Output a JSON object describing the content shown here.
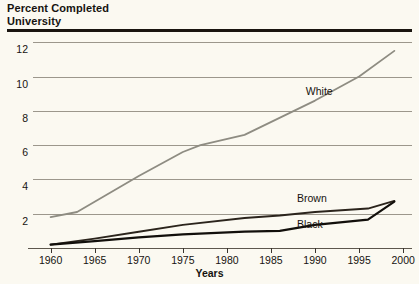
{
  "title": "Percent Completed\nUniversity",
  "chart_data": {
    "type": "line",
    "title": "Percent Completed University",
    "xlabel": "Years",
    "ylabel": "",
    "xlim": [
      1958,
      2001
    ],
    "ylim": [
      0,
      12.6
    ],
    "grid": true,
    "legend_position": "inline-labels",
    "xticks": [
      1960,
      1965,
      1970,
      1975,
      1980,
      1985,
      1990,
      1995,
      2000
    ],
    "xtick_labels": [
      "1960",
      "1965",
      "1970",
      "1975",
      "1980",
      "1985",
      "1990",
      "1995",
      "2000"
    ],
    "yticks": [
      2,
      4,
      6,
      8,
      10,
      12
    ],
    "ytick_labels": [
      "2",
      "4",
      "6",
      "8",
      "10",
      "12"
    ],
    "series": [
      {
        "name": "White",
        "color": "#8e8c82",
        "width": 1.8,
        "label_x": 1991,
        "label_y": 9.1,
        "x": [
          1960,
          1963,
          1970,
          1975,
          1977,
          1982,
          1990,
          1995,
          1999
        ],
        "y": [
          1.8,
          2.1,
          4.2,
          5.6,
          6.0,
          6.6,
          8.6,
          10.0,
          11.5
        ]
      },
      {
        "name": "Brown",
        "color": "#2b241c",
        "width": 1.9,
        "label_x": 1990,
        "label_y": 2.85,
        "x": [
          1960,
          1965,
          1970,
          1975,
          1982,
          1986,
          1990,
          1996,
          1999
        ],
        "y": [
          0.2,
          0.55,
          0.95,
          1.35,
          1.75,
          1.9,
          2.1,
          2.3,
          2.75
        ]
      },
      {
        "name": "Black",
        "color": "#120f0b",
        "width": 2.2,
        "label_x": 1990,
        "label_y": 1.35,
        "x": [
          1960,
          1965,
          1970,
          1975,
          1982,
          1986,
          1990,
          1996,
          1999
        ],
        "y": [
          0.2,
          0.4,
          0.62,
          0.8,
          0.95,
          1.0,
          1.35,
          1.65,
          2.7
        ]
      }
    ]
  },
  "axis": {
    "x_title": "Years"
  }
}
